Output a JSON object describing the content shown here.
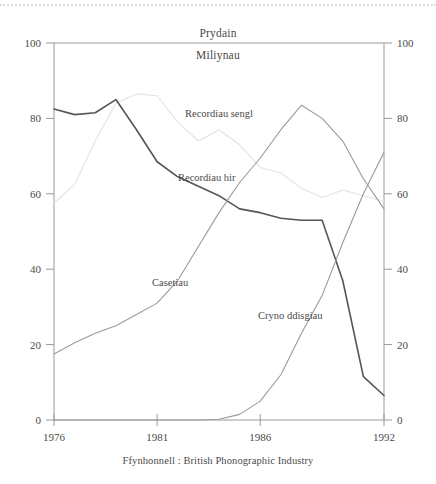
{
  "chart_data": {
    "type": "line",
    "title": "Prydain",
    "subtitle": "Miliynau",
    "source_note": "Ffynhonnell : British Phonographic Industry",
    "xlabel": "",
    "ylabel": "",
    "xlim": [
      1976,
      1992
    ],
    "ylim": [
      0,
      100
    ],
    "grid": false,
    "legend": "inline-labels",
    "x": [
      1976,
      1977,
      1978,
      1979,
      1980,
      1981,
      1982,
      1983,
      1984,
      1985,
      1986,
      1987,
      1988,
      1989,
      1990,
      1991,
      1992
    ],
    "x_ticks": [
      1976,
      1981,
      1986,
      1992
    ],
    "x_tick_labels": [
      "1976",
      "1981",
      "1986",
      "1992"
    ],
    "y_ticks": [
      0,
      20,
      40,
      60,
      80,
      100
    ],
    "y_tick_labels": [
      "0",
      "20",
      "40",
      "60",
      "80",
      "100"
    ],
    "y_ticks_right": [
      0,
      20,
      40,
      60,
      80,
      100
    ],
    "y_tick_labels_right": [
      "0",
      "20",
      "40",
      "60",
      "80",
      "100"
    ],
    "series": [
      {
        "name": "Recordiau sengl",
        "label": "Recordiau sengl",
        "color": "#e3e3e3",
        "label_x": 185,
        "label_y": 117,
        "values": [
          57.5,
          62.5,
          74,
          84,
          86.5,
          86,
          79,
          74,
          77,
          73,
          67,
          65.5,
          61.5,
          59,
          61,
          59.5,
          58
        ]
      },
      {
        "name": "Recordiau hir",
        "label": "Recordiau hir",
        "color": "#555555",
        "label_x": 178,
        "label_y": 181,
        "values": [
          82.5,
          81,
          81.5,
          85,
          77,
          68.5,
          64.5,
          62,
          59.5,
          56,
          55,
          53.5,
          53,
          53,
          37,
          11.5,
          6.5
        ]
      },
      {
        "name": "Casetiau",
        "label": "Casetiau",
        "color": "#9a9a9a",
        "label_x": 152,
        "label_y": 286,
        "values": [
          17.5,
          20.5,
          23,
          25,
          28,
          31,
          37,
          46,
          55,
          63,
          69.5,
          77,
          83.5,
          80,
          74,
          64,
          56
        ]
      },
      {
        "name": "Cryno ddisgiau",
        "label": "Cryno ddisgiau",
        "color": "#9a9a9a",
        "label_x": 258,
        "label_y": 319,
        "values": [
          0,
          0,
          0,
          0,
          0,
          0,
          0,
          0,
          0.2,
          1.5,
          5,
          12,
          23,
          33,
          47,
          60,
          71
        ]
      }
    ]
  },
  "axes": {
    "left_axis_name": "y-axis-left",
    "right_axis_name": "y-axis-right",
    "bottom_axis_name": "x-axis"
  }
}
